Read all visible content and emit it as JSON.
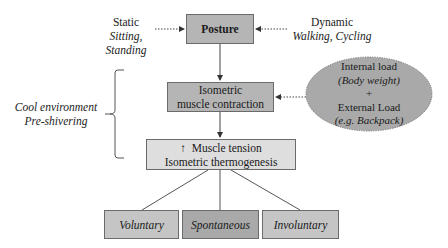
{
  "diagram": {
    "posture": {
      "label": "Posture"
    },
    "static": {
      "title": "Static",
      "subtitle": "Sitting, Standing"
    },
    "dynamic": {
      "title": "Dynamic",
      "subtitle": "Walking, Cycling"
    },
    "isometric": {
      "line1": "Isometric",
      "line2": "muscle contraction"
    },
    "environment": {
      "line1": "Cool environment",
      "line2": "Pre-shivering"
    },
    "load": {
      "line1": "Internal load",
      "line2": "(Body weight)",
      "line3": "+",
      "line4": "External Load",
      "line5": "(e.g. Backpack)"
    },
    "tension": {
      "arrow": "↑",
      "line1": "Muscle tension",
      "line2": "Isometric thermogenesis"
    },
    "outcomes": [
      {
        "label": "Voluntary"
      },
      {
        "label": "Spontaneous"
      },
      {
        "label": "Involuntary"
      }
    ],
    "colors": {
      "box_dark": "#b5b5b5",
      "box_light": "#dedede",
      "box_mid": "#c5c5c5",
      "box_spontaneous": "#a9a9a9",
      "ellipse": "#a9a9a9",
      "border": "#6b6b6b"
    }
  }
}
